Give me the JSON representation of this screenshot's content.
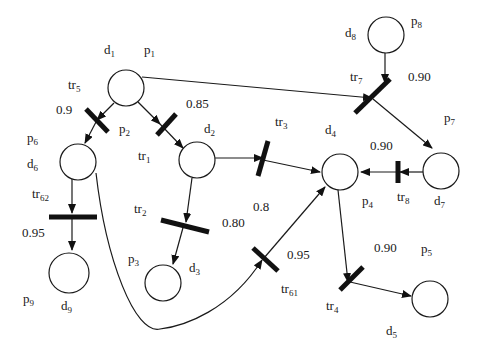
{
  "places": [
    {
      "id": "p1",
      "place": "p",
      "place_sub": "1",
      "prop": "d",
      "prop_sub": "1"
    },
    {
      "id": "p2",
      "place": "p",
      "place_sub": "2",
      "prop": "d",
      "prop_sub": "2"
    },
    {
      "id": "p3",
      "place": "p",
      "place_sub": "3",
      "prop": "d",
      "prop_sub": "3"
    },
    {
      "id": "p4",
      "place": "p",
      "place_sub": "4",
      "prop": "d",
      "prop_sub": "4"
    },
    {
      "id": "p5",
      "place": "p",
      "place_sub": "5",
      "prop": "d",
      "prop_sub": "5"
    },
    {
      "id": "p6",
      "place": "p",
      "place_sub": "6",
      "prop": "d",
      "prop_sub": "6"
    },
    {
      "id": "p7",
      "place": "p",
      "place_sub": "7",
      "prop": "d",
      "prop_sub": "7"
    },
    {
      "id": "p8",
      "place": "p",
      "place_sub": "8",
      "prop": "d",
      "prop_sub": "8"
    },
    {
      "id": "p9",
      "place": "p",
      "place_sub": "9",
      "prop": "d",
      "prop_sub": "9"
    }
  ],
  "transitions": [
    {
      "id": "tr1",
      "name": "tr",
      "sub": "1",
      "cf": "0.85",
      "from": [
        "p1"
      ],
      "to": [
        "p2"
      ]
    },
    {
      "id": "tr2",
      "name": "tr",
      "sub": "2",
      "cf": "0.80",
      "from": [
        "p2"
      ],
      "to": [
        "p3"
      ]
    },
    {
      "id": "tr3",
      "name": "tr",
      "sub": "3",
      "cf": "0.8",
      "from": [
        "p2"
      ],
      "to": [
        "p4"
      ]
    },
    {
      "id": "tr4",
      "name": "tr",
      "sub": "4",
      "cf": "0.90",
      "from": [
        "p4"
      ],
      "to": [
        "p5"
      ]
    },
    {
      "id": "tr5",
      "name": "tr",
      "sub": "5",
      "cf": "0.9",
      "from": [
        "p1"
      ],
      "to": [
        "p6"
      ]
    },
    {
      "id": "tr61",
      "name": "tr",
      "sub": "61",
      "cf": "0.95",
      "from": [
        "p6"
      ],
      "to": [
        "p4"
      ]
    },
    {
      "id": "tr62",
      "name": "tr",
      "sub": "62",
      "cf": "0.95",
      "from": [
        "p6"
      ],
      "to": [
        "p9"
      ]
    },
    {
      "id": "tr7",
      "name": "tr",
      "sub": "7",
      "cf": "0.90",
      "from": [
        "p1",
        "p8"
      ],
      "to": [
        "p7"
      ]
    },
    {
      "id": "tr8",
      "name": "tr",
      "sub": "8",
      "cf": "0.90",
      "from": [
        "p7"
      ],
      "to": [
        "p4"
      ]
    }
  ]
}
